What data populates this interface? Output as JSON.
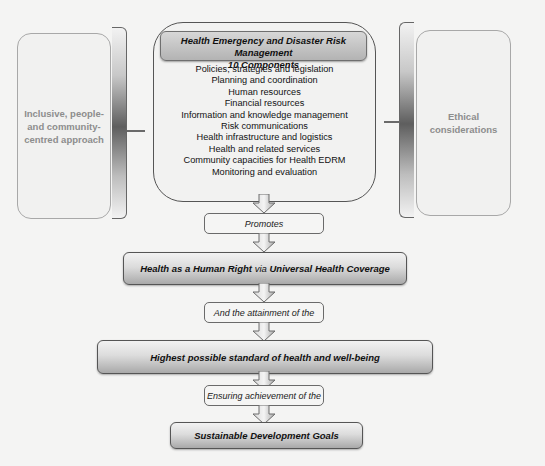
{
  "left_box": {
    "lines": [
      "Inclusive, people-",
      "and community-",
      "centred approach"
    ]
  },
  "right_box": {
    "lines": [
      "Ethical",
      "considerations"
    ]
  },
  "center": {
    "header": {
      "line1": "Health Emergency and Disaster Risk Management",
      "line2": "10 Components"
    },
    "components": [
      "Policies, strategies and legislation",
      "Planning and coordination",
      "Human resources",
      "Financial resources",
      "Information and knowledge management",
      "Risk communications",
      "Health infrastructure and logistics",
      "Health and related services",
      "Community capacities for Health EDRM",
      "Monitoring and evaluation"
    ]
  },
  "flow": {
    "promotes": "Promotes",
    "human_right": {
      "part1": "Health as a Human Right",
      "part2": " via ",
      "part3": "Universal Health Coverage"
    },
    "attainment": "And the attainment of the",
    "highest": "Highest possible standard of health and well-being",
    "ensuring": "Ensuring achievement of the",
    "sdg": "Sustainable Development Goals"
  },
  "colors": {
    "background": "#f4f4f3",
    "box_border": "#555555",
    "side_text": "#8d8d8d"
  }
}
